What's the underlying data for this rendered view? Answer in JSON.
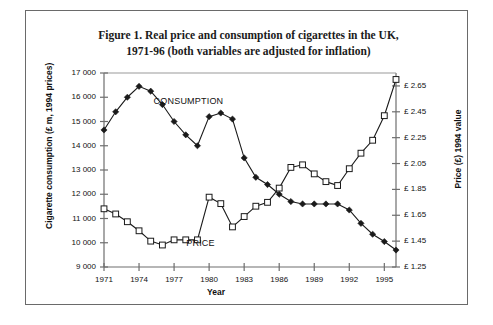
{
  "figure": {
    "title_line1": "Figure 1. Real price and consumption of cigarettes in the UK,",
    "title_line2": "1971-96 (both variables are adjusted for inflation)"
  },
  "chart_data": {
    "type": "line",
    "title": "Figure 1. Real price and consumption of cigarettes in the UK, 1971-96 (both variables are adjusted for inflation)",
    "xlabel": "Year",
    "ylabel": "Cigarette consumption (£ m, 1994 prices)",
    "ylabel_right": "Price (£) 1994 value",
    "x": [
      1971,
      1972,
      1973,
      1974,
      1975,
      1976,
      1977,
      1978,
      1979,
      1980,
      1981,
      1982,
      1983,
      1984,
      1985,
      1986,
      1987,
      1988,
      1989,
      1990,
      1991,
      1992,
      1993,
      1994,
      1995,
      1996
    ],
    "xlim": [
      1971,
      1996
    ],
    "xticks": [
      1971,
      1974,
      1977,
      1980,
      1983,
      1986,
      1989,
      1992,
      1995
    ],
    "xtick_labels": [
      "1971",
      "1974",
      "1977",
      "1980",
      "1983",
      "1986",
      "1989",
      "1992",
      "1995"
    ],
    "ylim": [
      9000,
      17000
    ],
    "yticks": [
      9000,
      10000,
      11000,
      12000,
      13000,
      14000,
      15000,
      16000,
      17000
    ],
    "ytick_labels": [
      "9 000",
      "10 000",
      "11 000",
      "12 000",
      "13 000",
      "14 000",
      "15 000",
      "16 000",
      "17 000"
    ],
    "ylim_right": [
      1.25,
      2.75
    ],
    "yticks_right": [
      1.25,
      1.45,
      1.65,
      1.85,
      2.05,
      2.25,
      2.45,
      2.65
    ],
    "ytick_labels_right": [
      "£ 1.25",
      "£ 1.45",
      "£ 1.65",
      "£ 1.85",
      "£ 2.05",
      "£ 2.25",
      "£ 2.45",
      "£ 2.65"
    ],
    "grid": false,
    "legend": "inline-annotations",
    "series": [
      {
        "name": "CONSUMPTION",
        "axis": "left",
        "marker": "filled-diamond",
        "color": "#1a1a1a",
        "values": [
          14650,
          15400,
          16000,
          16450,
          16250,
          15700,
          15000,
          14450,
          14000,
          15200,
          15350,
          15100,
          13500,
          12700,
          12400,
          12000,
          11700,
          11600,
          11600,
          11600,
          11600,
          11350,
          10800,
          10350,
          10050,
          9700
        ]
      },
      {
        "name": "PRICE",
        "axis": "right",
        "marker": "open-square",
        "color": "#1a1a1a",
        "values": [
          1.7,
          1.66,
          1.6,
          1.53,
          1.45,
          1.42,
          1.46,
          1.46,
          1.46,
          1.79,
          1.74,
          1.56,
          1.64,
          1.72,
          1.75,
          1.86,
          2.02,
          2.04,
          1.97,
          1.91,
          1.88,
          2.01,
          2.13,
          2.23,
          2.42,
          2.7
        ]
      }
    ],
    "annotations": [
      {
        "text": "CONSUMPTION",
        "x": 1978.5,
        "y": 15800
      },
      {
        "text": "PRICE",
        "x": 1976.5,
        "y": 9950
      }
    ]
  }
}
